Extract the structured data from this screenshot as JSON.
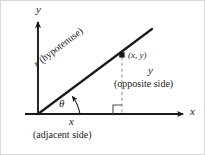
{
  "figure": {
    "background": "#ffffff",
    "border_color": "#d9d9d9",
    "ink_color": "#1a1a1a",
    "dash_color": "#8a8a8a"
  },
  "axes": {
    "y_label": "y",
    "x_label": "x",
    "origin": {
      "x": 38,
      "y": 114
    },
    "y_tip": {
      "x": 38,
      "y": 20
    },
    "x_tip": {
      "x": 185,
      "y": 114
    },
    "x_start": {
      "x": 25,
      "y": 114
    }
  },
  "point": {
    "label": "(x, y)",
    "x": 122,
    "y": 55
  },
  "angle": {
    "symbol": "θ",
    "name": "theta",
    "degrees": 37
  },
  "sides": {
    "hypotenuse": {
      "var": "r",
      "text": " (hypotenuse)",
      "full": "r (hypotenuse)"
    },
    "opposite": {
      "var": "y",
      "text": "(opposite side)"
    },
    "adjacent": {
      "var": "x",
      "text": "(adjacent side)"
    }
  },
  "markers": {
    "right_angle": "right-angle-square",
    "dashed_drop_line": "vertical dashed segment from point to x-axis"
  }
}
